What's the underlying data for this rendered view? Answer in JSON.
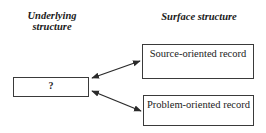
{
  "diagram": {
    "headers": {
      "left": "Underlying structure",
      "right": "Surface structure"
    },
    "nodes": [
      {
        "id": "unknown",
        "label": "?"
      },
      {
        "id": "source",
        "label": "Source-oriented record"
      },
      {
        "id": "problem",
        "label": "Problem-oriented record"
      }
    ],
    "edges": [
      {
        "from": "unknown",
        "to": "source",
        "type": "bidirectional-arrow"
      },
      {
        "from": "unknown",
        "to": "problem",
        "type": "bidirectional-arrow"
      }
    ],
    "colors": {
      "line": "#2a2a2a",
      "background": "#ffffff",
      "text": "#222222"
    }
  }
}
